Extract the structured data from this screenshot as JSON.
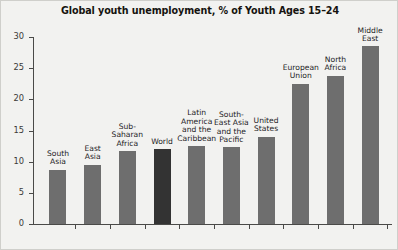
{
  "chart_data": {
    "type": "bar",
    "title": "Global youth unemployment, % of Youth Ages 15–24",
    "xlabel": "",
    "ylabel": "",
    "ylim": [
      0,
      30
    ],
    "yticks": [
      0,
      5,
      10,
      15,
      20,
      25,
      30
    ],
    "ytick_labels": [
      "0",
      "5",
      "10",
      "15",
      "20",
      "25",
      "30"
    ],
    "grid": false,
    "legend": "none",
    "highlight_category": "World",
    "colors": {
      "bar": "#6e6e6e",
      "bar_highlight": "#333333",
      "background": "#f2f2f0",
      "axis": "#4a4a48",
      "text": "#24221f",
      "title": "#15130f",
      "border": "#cfcfcb"
    },
    "categories": [
      "South Asia",
      "East Asia",
      "Sub-Saharan Africa",
      "World",
      "Latin America and the Caribbean",
      "South-East Asia and the Pacific",
      "United States",
      "European Union",
      "North Africa",
      "Middle East"
    ],
    "category_label_lines": [
      "South\nAsia",
      "East\nAsia",
      "Sub-\nSaharan\nAfrica",
      "World",
      "Latin\nAmerica\nand the\nCaribbean",
      "South-\nEast Asia\nand the\nPacific",
      "United\nStates",
      "European\nUnion",
      "North\nAfrica",
      "Middle\nEast"
    ],
    "values": [
      8.7,
      9.5,
      11.7,
      12.0,
      12.5,
      12.3,
      14.0,
      22.5,
      23.8,
      28.5
    ]
  }
}
